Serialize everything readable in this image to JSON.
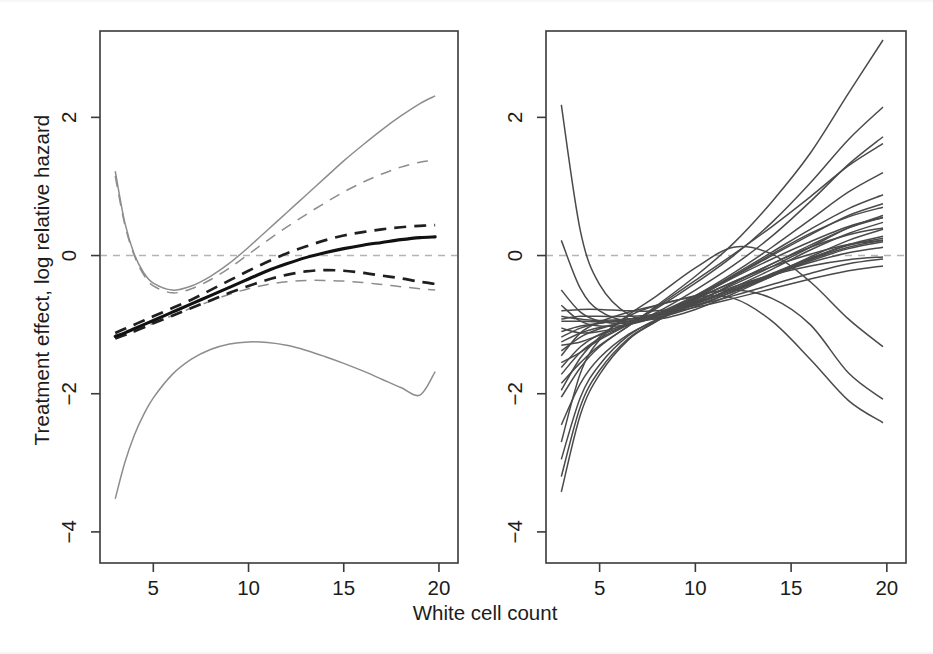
{
  "figure": {
    "title": "",
    "xlabel": "White cell count",
    "ylabel": "Treatment effect, log relative hazard",
    "panels": [
      "left-estimate-panel",
      "right-bootstrap-panel"
    ]
  },
  "axes": {
    "x_ticks": [
      "5",
      "10",
      "15",
      "20"
    ],
    "y_ticks": [
      "2",
      "0",
      "-2",
      "-4"
    ],
    "x_tick_values": [
      5,
      10,
      15,
      20
    ],
    "y_tick_values": [
      2,
      0,
      -2,
      -4
    ],
    "xlim": [
      2.2,
      21.0
    ],
    "ylim": [
      -4.45,
      3.25
    ]
  },
  "colors": {
    "estimate": "#111111",
    "confidence_dashed": "#1f1f1f",
    "confidence_solid": "#8d8d8d",
    "zero_reference": "#b4b4b4",
    "bootstrap": "#4a4a4a",
    "frame": "#3a3a3a",
    "background": "#ffffff"
  },
  "chart_data": {
    "type": "line",
    "title": "",
    "xlabel": "White cell count",
    "ylabel": "Treatment effect, log relative hazard",
    "xlim": [
      2.2,
      21.0
    ],
    "ylim": [
      -4.45,
      3.25
    ],
    "xticks": [
      5,
      10,
      15,
      20
    ],
    "yticks": [
      -4,
      -2,
      0,
      2
    ],
    "grid": false,
    "legend": "none",
    "annotations": [
      "zero reference line at y = 0 (dashed grey) in both panels"
    ],
    "panels": [
      {
        "name": "Estimated treatment effect with confidence bands",
        "x": [
          3.0,
          3.5,
          4.0,
          4.5,
          5.0,
          6.0,
          7.0,
          8.0,
          9.0,
          10.0,
          11.0,
          12.0,
          13.0,
          14.0,
          15.0,
          16.0,
          17.0,
          18.0,
          19.0,
          19.8
        ],
        "series": [
          {
            "name": "Estimate (solid black)",
            "style": "solid",
            "color": "#111111",
            "values": [
              -1.17,
              -1.12,
              -1.06,
              -1.0,
              -0.94,
              -0.82,
              -0.7,
              -0.58,
              -0.46,
              -0.34,
              -0.22,
              -0.12,
              -0.03,
              0.04,
              0.1,
              0.15,
              0.19,
              0.23,
              0.26,
              0.27
            ]
          },
          {
            "name": "Upper pointwise CI (dashed black)",
            "style": "dashed",
            "color": "#1f1f1f",
            "values": [
              -1.12,
              -1.06,
              -1.0,
              -0.94,
              -0.88,
              -0.76,
              -0.64,
              -0.5,
              -0.36,
              -0.22,
              -0.09,
              0.03,
              0.13,
              0.22,
              0.29,
              0.34,
              0.38,
              0.41,
              0.43,
              0.44
            ]
          },
          {
            "name": "Lower pointwise CI (dashed black)",
            "style": "dashed",
            "color": "#1f1f1f",
            "values": [
              -1.2,
              -1.15,
              -1.1,
              -1.04,
              -0.98,
              -0.87,
              -0.76,
              -0.65,
              -0.54,
              -0.44,
              -0.35,
              -0.28,
              -0.23,
              -0.21,
              -0.22,
              -0.25,
              -0.29,
              -0.33,
              -0.38,
              -0.41
            ]
          },
          {
            "name": "Upper wide band (solid grey)",
            "style": "solid",
            "color": "#8d8d8d",
            "values": [
              1.22,
              0.48,
              0.02,
              -0.25,
              -0.4,
              -0.5,
              -0.44,
              -0.3,
              -0.11,
              0.12,
              0.37,
              0.62,
              0.87,
              1.12,
              1.37,
              1.6,
              1.82,
              2.02,
              2.2,
              2.31
            ]
          },
          {
            "name": "Upper wide band (dashed grey)",
            "style": "dashed",
            "color": "#8d8d8d",
            "values": [
              1.15,
              0.45,
              0.0,
              -0.28,
              -0.44,
              -0.54,
              -0.48,
              -0.35,
              -0.18,
              0.02,
              0.22,
              0.41,
              0.59,
              0.76,
              0.92,
              1.06,
              1.18,
              1.28,
              1.35,
              1.38
            ]
          },
          {
            "name": "Lower wide band (solid grey)",
            "style": "solid",
            "color": "#8d8d8d",
            "values": [
              -3.52,
              -3.0,
              -2.6,
              -2.3,
              -2.06,
              -1.72,
              -1.5,
              -1.36,
              -1.28,
              -1.25,
              -1.26,
              -1.3,
              -1.37,
              -1.46,
              -1.56,
              -1.67,
              -1.79,
              -1.91,
              -2.02,
              -1.68
            ]
          },
          {
            "name": "Lower wide band (dashed grey)",
            "style": "dashed",
            "color": "#8d8d8d",
            "values": [
              -1.2,
              -1.15,
              -1.1,
              -1.04,
              -0.98,
              -0.87,
              -0.76,
              -0.66,
              -0.56,
              -0.48,
              -0.42,
              -0.38,
              -0.36,
              -0.36,
              -0.37,
              -0.39,
              -0.42,
              -0.45,
              -0.48,
              -0.5
            ]
          }
        ]
      },
      {
        "name": "Bootstrap replicate curves",
        "n_curves": 26,
        "x": [
          3.0,
          4.0,
          5.0,
          6.5,
          8.0,
          10.0,
          12.0,
          14.0,
          16.0,
          18.0,
          19.8
        ],
        "series": [
          {
            "name": "boot-01",
            "values": [
              2.18,
              0.35,
              -0.42,
              -0.85,
              -0.92,
              -0.78,
              -0.55,
              -0.3,
              -0.05,
              0.15,
              0.25
            ]
          },
          {
            "name": "boot-02",
            "values": [
              0.22,
              -0.48,
              -0.8,
              -0.95,
              -0.9,
              -0.68,
              -0.4,
              -0.12,
              0.12,
              0.3,
              0.4
            ]
          },
          {
            "name": "boot-03",
            "values": [
              -0.5,
              -0.82,
              -0.95,
              -0.98,
              -0.88,
              -0.62,
              -0.3,
              0.02,
              0.32,
              0.56,
              0.7
            ]
          },
          {
            "name": "boot-04",
            "values": [
              -0.72,
              -0.95,
              -1.02,
              -1.0,
              -0.88,
              -0.6,
              -0.28,
              0.05,
              0.38,
              0.68,
              0.88
            ]
          },
          {
            "name": "boot-05",
            "values": [
              -1.05,
              -1.12,
              -1.1,
              -1.0,
              -0.86,
              -0.58,
              -0.25,
              0.12,
              0.52,
              0.92,
              1.2
            ]
          },
          {
            "name": "boot-06",
            "values": [
              -1.3,
              -1.25,
              -1.15,
              -1.0,
              -0.82,
              -0.5,
              -0.14,
              0.28,
              0.78,
              1.32,
              1.72
            ]
          },
          {
            "name": "boot-07",
            "values": [
              -1.55,
              -1.4,
              -1.22,
              -1.0,
              -0.76,
              -0.4,
              0.0,
              0.48,
              1.05,
              1.68,
              2.15
            ]
          },
          {
            "name": "boot-08",
            "values": [
              -1.85,
              -1.55,
              -1.3,
              -1.02,
              -0.72,
              -0.3,
              0.18,
              0.78,
              1.48,
              2.35,
              3.12
            ]
          },
          {
            "name": "boot-09",
            "values": [
              -2.05,
              -1.62,
              -1.32,
              -1.02,
              -0.74,
              -0.36,
              0.02,
              0.42,
              0.85,
              1.3,
              1.62
            ]
          },
          {
            "name": "boot-10",
            "values": [
              -3.42,
              -2.3,
              -1.72,
              -1.22,
              -0.95,
              -0.62,
              -0.32,
              -0.05,
              0.2,
              0.42,
              0.55
            ]
          },
          {
            "name": "boot-11",
            "values": [
              -3.2,
              -2.18,
              -1.66,
              -1.2,
              -0.94,
              -0.64,
              -0.38,
              -0.16,
              0.02,
              0.16,
              0.22
            ]
          },
          {
            "name": "boot-12",
            "values": [
              -2.95,
              -2.05,
              -1.58,
              -1.16,
              -0.92,
              -0.66,
              -0.45,
              -0.28,
              -0.15,
              -0.06,
              -0.02
            ]
          },
          {
            "name": "boot-13",
            "values": [
              -1.18,
              -1.05,
              -0.98,
              -0.92,
              -0.86,
              -0.72,
              -0.52,
              -0.3,
              -0.08,
              0.1,
              0.2
            ]
          },
          {
            "name": "boot-14",
            "values": [
              -0.88,
              -0.92,
              -0.94,
              -0.92,
              -0.86,
              -0.7,
              -0.5,
              -0.28,
              -0.06,
              0.12,
              0.22
            ]
          },
          {
            "name": "boot-15",
            "values": [
              -0.92,
              -0.88,
              -0.88,
              -0.88,
              -0.85,
              -0.75,
              -0.62,
              -0.48,
              -0.34,
              -0.22,
              -0.15
            ]
          },
          {
            "name": "boot-16",
            "values": [
              -1.38,
              -1.18,
              -1.06,
              -0.95,
              -0.85,
              -0.68,
              -0.48,
              -0.26,
              -0.04,
              0.16,
              0.28
            ]
          },
          {
            "name": "boot-17",
            "values": [
              -1.62,
              -1.32,
              -1.14,
              -0.98,
              -0.84,
              -0.62,
              -0.38,
              -0.12,
              0.15,
              0.4,
              0.55
            ]
          },
          {
            "name": "boot-18",
            "values": [
              -1.1,
              -1.02,
              -0.98,
              -0.92,
              -0.84,
              -0.66,
              -0.42,
              -0.16,
              0.12,
              0.4,
              0.58
            ]
          },
          {
            "name": "boot-19",
            "values": [
              -0.95,
              -0.95,
              -0.96,
              -0.95,
              -0.9,
              -0.74,
              -0.52,
              -0.28,
              -0.02,
              0.22,
              0.38
            ]
          },
          {
            "name": "boot-20",
            "values": [
              -2.45,
              -1.85,
              -1.48,
              -1.14,
              -0.94,
              -0.7,
              -0.48,
              -0.28,
              -0.1,
              0.04,
              0.12
            ]
          },
          {
            "name": "boot-21",
            "values": [
              -1.72,
              -1.4,
              -1.2,
              -1.0,
              -0.84,
              -0.58,
              -0.3,
              0.0,
              0.3,
              0.58,
              0.75
            ]
          },
          {
            "name": "boot-22",
            "values": [
              -1.25,
              -1.12,
              -1.04,
              -0.96,
              -0.88,
              -0.7,
              -0.46,
              -0.2,
              0.08,
              0.32,
              0.48
            ]
          },
          {
            "name": "boot-23 (down-turning)",
            "values": [
              -2.7,
              -1.7,
              -1.22,
              -0.88,
              -0.72,
              -0.6,
              -0.62,
              -0.95,
              -1.5,
              -2.1,
              -2.42
            ]
          },
          {
            "name": "boot-24 (down-turning)",
            "values": [
              -1.45,
              -1.12,
              -0.96,
              -0.82,
              -0.72,
              -0.58,
              -0.5,
              -0.62,
              -1.0,
              -1.7,
              -2.08
            ]
          },
          {
            "name": "boot-25 (peak then fall)",
            "values": [
              -1.95,
              -1.48,
              -1.18,
              -0.86,
              -0.58,
              -0.18,
              0.12,
              0.02,
              -0.38,
              -0.92,
              -1.32
            ]
          },
          {
            "name": "boot-26 (flat high)",
            "values": [
              -0.8,
              -0.78,
              -0.78,
              -0.8,
              -0.8,
              -0.72,
              -0.58,
              -0.42,
              -0.26,
              -0.12,
              -0.05
            ]
          }
        ]
      }
    ]
  }
}
